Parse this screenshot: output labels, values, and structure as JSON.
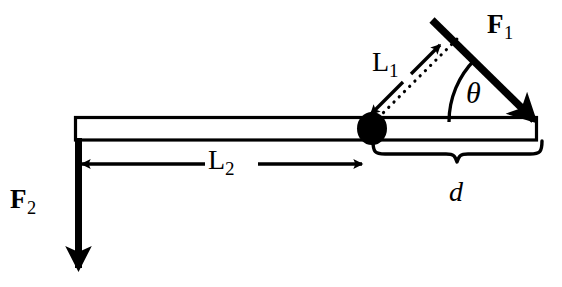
{
  "figure": {
    "background_color": "#ffffff",
    "stroke_color": "#000000",
    "width": 562,
    "height": 287
  },
  "labels": {
    "force_1": {
      "symbol": "F",
      "subscript": "1",
      "full": "F1"
    },
    "force_2": {
      "symbol": "F",
      "subscript": "2",
      "full": "F2"
    },
    "length_1": {
      "symbol": "L",
      "subscript": "1",
      "full": "L1"
    },
    "length_2": {
      "symbol": "L",
      "subscript": "2",
      "full": "L2"
    },
    "angle": {
      "symbol": "θ",
      "full": "theta"
    },
    "distance": {
      "symbol": "d",
      "full": "d"
    }
  },
  "elements": {
    "beam": {
      "name": "horizontal-beam",
      "x1": 75,
      "y1": 117,
      "x2": 537,
      "y2": 140
    },
    "pivot": {
      "name": "pivot-point",
      "cx": 372,
      "cy": 128,
      "rx": 15,
      "ry": 16
    },
    "force1_arrow": {
      "name": "force-1-arrow",
      "from_x": 432,
      "from_y": 20,
      "to_x": 537,
      "to_y": 122,
      "direction": "down-right"
    },
    "force2_arrow": {
      "name": "force-2-arrow",
      "from_x": 78,
      "from_y": 140,
      "to_x": 78,
      "to_y": 276,
      "direction": "down"
    },
    "length1_dotted": {
      "name": "length-1-dotted-line",
      "from_x": 372,
      "from_y": 122,
      "to_x": 458,
      "to_y": 38
    },
    "length1_arrows": {
      "name": "length-1-double-arrow",
      "style": "double-headed"
    },
    "length2_dimension": {
      "name": "length-2-dimension-line",
      "from_x": 78,
      "from_y": 164,
      "to_x": 366,
      "to_y": 164,
      "style": "double-headed"
    },
    "angle_arc": {
      "name": "angle-arc",
      "center_x": 537,
      "center_y": 122,
      "radius": 88,
      "from_deg": 180,
      "to_deg": 135
    },
    "distance_brace": {
      "name": "distance-brace",
      "from_x": 372,
      "from_y": 146,
      "to_x": 541,
      "to_y": 146,
      "orientation": "bottom"
    }
  }
}
